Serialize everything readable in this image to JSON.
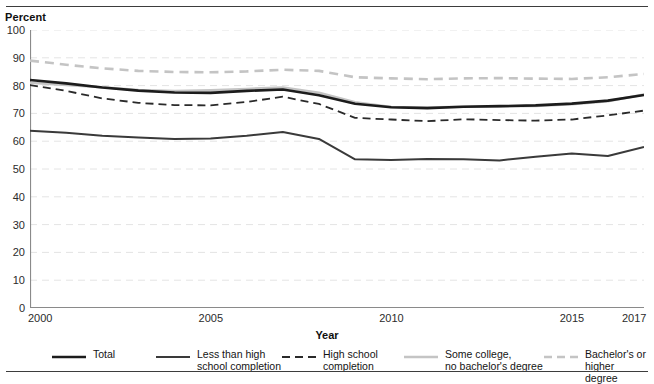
{
  "figure": {
    "y_axis_caption": "Percent",
    "x_axis_title": "Year"
  },
  "chart_data": {
    "type": "line",
    "title": "",
    "xlabel": "Year",
    "ylabel": "Percent",
    "xlim": [
      2000,
      2017
    ],
    "ylim": [
      0,
      100
    ],
    "ytick_labels": [
      "100",
      "90",
      "80",
      "70",
      "60",
      "50",
      "40",
      "30",
      "20",
      "10",
      "0"
    ],
    "yticks": [
      100,
      90,
      80,
      70,
      60,
      50,
      40,
      30,
      20,
      10,
      0
    ],
    "xtick_labels": [
      "2000",
      "2005",
      "2010",
      "2015",
      "2017"
    ],
    "xticks": [
      2000,
      2005,
      2010,
      2015,
      2017
    ],
    "grid": "horizontal-dashed",
    "legend_position": "below",
    "x": [
      2000,
      2001,
      2002,
      2003,
      2004,
      2005,
      2006,
      2007,
      2008,
      2009,
      2010,
      2011,
      2012,
      2013,
      2014,
      2015,
      2016,
      2017
    ],
    "series": [
      {
        "name": "Total",
        "label": "Total",
        "style": "solid",
        "color": "#1c1c1c",
        "width": 2.6,
        "values": [
          82.0,
          80.8,
          79.3,
          78.2,
          77.5,
          77.4,
          78.1,
          78.6,
          76.5,
          73.5,
          72.2,
          71.9,
          72.4,
          72.6,
          72.9,
          73.5,
          74.6,
          76.6
        ]
      },
      {
        "name": "Less than high school completion",
        "label": "Less than high\nschool completion",
        "style": "solid",
        "color": "#3a3a3a",
        "width": 2.0,
        "values": [
          63.8,
          63.0,
          62.0,
          61.3,
          60.8,
          61.0,
          62.0,
          63.3,
          60.8,
          53.5,
          53.2,
          53.6,
          53.5,
          53.1,
          54.4,
          55.6,
          54.7,
          57.9
        ]
      },
      {
        "name": "High school completion",
        "label": "High school\ncompletion",
        "style": "dashed",
        "color": "#2a2a2a",
        "width": 1.8,
        "values": [
          80.2,
          78.1,
          75.4,
          73.8,
          73.0,
          72.9,
          74.1,
          76.0,
          73.4,
          68.4,
          67.8,
          67.2,
          67.9,
          67.6,
          67.4,
          67.8,
          69.3,
          71.0
        ]
      },
      {
        "name": "Some college, no bachelor's degree",
        "label": "Some college,\nno bachelor's degree",
        "style": "solid",
        "color": "#c4c4c4",
        "width": 2.6,
        "values": [
          81.0,
          80.2,
          79.4,
          78.4,
          78.0,
          78.3,
          78.8,
          79.3,
          77.4,
          74.0,
          72.3,
          72.1,
          72.4,
          72.5,
          72.7,
          73.3,
          74.4,
          76.8
        ]
      },
      {
        "name": "Bachelor's or higher degree",
        "label": "Bachelor's or\nhigher degree",
        "style": "dashed",
        "color": "#c4c4c4",
        "width": 2.6,
        "values": [
          89.0,
          87.5,
          86.2,
          85.3,
          84.9,
          84.8,
          85.1,
          85.7,
          85.3,
          83.0,
          82.6,
          82.3,
          82.6,
          82.7,
          82.5,
          82.4,
          83.0,
          84.2
        ]
      }
    ]
  },
  "legend": {
    "items": [
      {
        "label": "Total",
        "swatch": "solid-dark-thick"
      },
      {
        "label": "Less than high\nschool completion",
        "swatch": "solid-dark"
      },
      {
        "label": "High school\ncompletion",
        "swatch": "dashed-dark"
      },
      {
        "label": "Some college,\nno bachelor's degree",
        "swatch": "solid-gray"
      },
      {
        "label": "Bachelor's or\nhigher degree",
        "swatch": "dashed-gray"
      }
    ]
  }
}
